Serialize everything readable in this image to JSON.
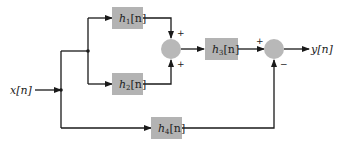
{
  "diagram": {
    "type": "block-diagram",
    "input": {
      "label": "x[n]"
    },
    "output": {
      "label": "y[n]"
    },
    "blocks": [
      {
        "id": "h1",
        "base": "h",
        "sub": "1",
        "arg": "[n]"
      },
      {
        "id": "h2",
        "base": "h",
        "sub": "2",
        "arg": "[n]"
      },
      {
        "id": "h3",
        "base": "h",
        "sub": "3",
        "arg": "[n]"
      },
      {
        "id": "h4",
        "base": "h",
        "sub": "4",
        "arg": "[n]"
      }
    ],
    "junctions": [
      {
        "id": "sum1",
        "signs": {
          "top": "+",
          "bottom": "+"
        }
      },
      {
        "id": "sum2",
        "signs": {
          "left": "+",
          "bottom": "−"
        }
      }
    ],
    "colors": {
      "block_fill": "#b3b3b3",
      "junction_fill": "#b8b8b8",
      "line": "#1a1a1a",
      "background": "#ffffff"
    }
  }
}
